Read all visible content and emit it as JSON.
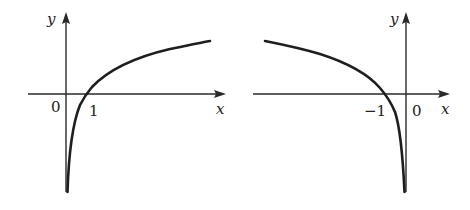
{
  "figure": {
    "panels": [
      {
        "name": "log-x",
        "description": "Graph of y = log(x), domain x > 0, passes through (1, 0)",
        "labels": {
          "y_axis": "y",
          "x_axis": "x",
          "origin": "0",
          "intercept": "1"
        }
      },
      {
        "name": "log-neg-x",
        "description": "Graph of y = log(-x), domain x < 0, passes through (-1, 0)",
        "labels": {
          "y_axis": "y",
          "x_axis": "x",
          "origin": "0",
          "intercept": "−1"
        }
      }
    ],
    "colors": {
      "curve": "#1e1e1e",
      "axis": "#2a2a2a",
      "background": "#ffffff"
    }
  }
}
